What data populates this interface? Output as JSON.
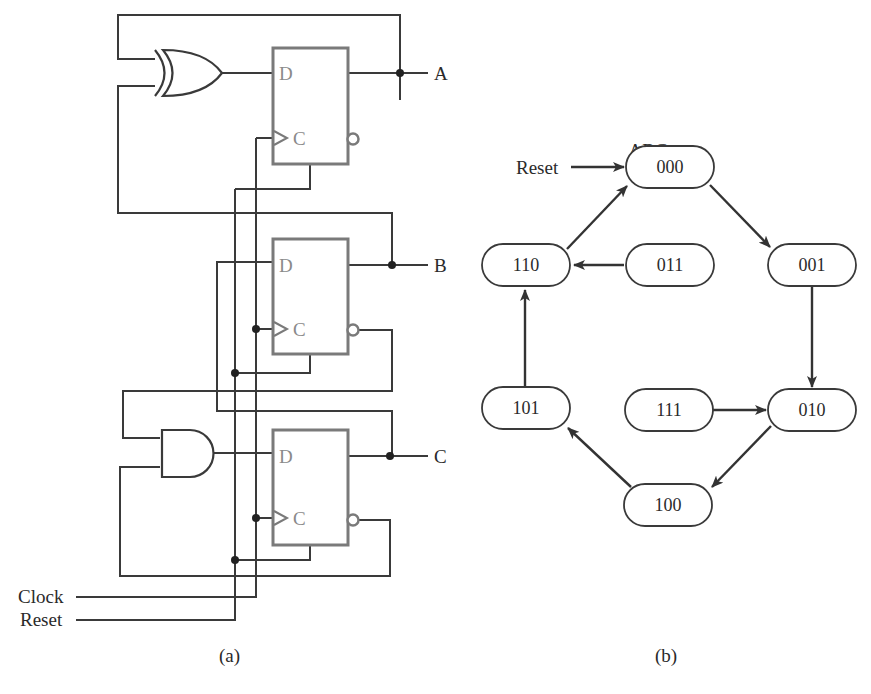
{
  "circuit": {
    "caption": "(a)",
    "outputs": [
      "A",
      "B",
      "C"
    ],
    "inputs": [
      "Clock",
      "Reset"
    ],
    "flip_flops": [
      {
        "name": "ff-a",
        "d_label": "D",
        "c_label": "C",
        "output": "A"
      },
      {
        "name": "ff-b",
        "d_label": "D",
        "c_label": "C",
        "output": "B"
      },
      {
        "name": "ff-c",
        "d_label": "D",
        "c_label": "C",
        "output": "C"
      }
    ],
    "gates": [
      {
        "type": "XOR",
        "drives": "A"
      },
      {
        "type": "AND",
        "drives": "C"
      }
    ]
  },
  "state_diagram": {
    "caption": "(b)",
    "header": "ABC",
    "reset_label": "Reset",
    "states": [
      "000",
      "001",
      "010",
      "100",
      "101",
      "110",
      "011",
      "111"
    ],
    "transitions": [
      [
        "000",
        "001"
      ],
      [
        "001",
        "010"
      ],
      [
        "010",
        "100"
      ],
      [
        "100",
        "101"
      ],
      [
        "101",
        "110"
      ],
      [
        "110",
        "000"
      ],
      [
        "011",
        "110"
      ],
      [
        "111",
        "010"
      ]
    ]
  }
}
